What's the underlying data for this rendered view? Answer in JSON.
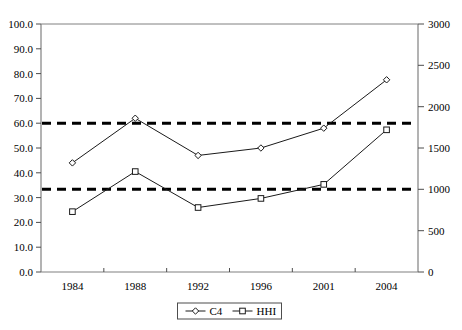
{
  "chart_data": {
    "type": "line",
    "title": "",
    "subtitle": "",
    "xlabel": "",
    "ylabel": "",
    "y2label": "",
    "categories": [
      "1984",
      "1988",
      "1992",
      "1996",
      "2001",
      "2004"
    ],
    "series": [
      {
        "name": "C4",
        "axis": "left",
        "marker": "diamond",
        "values": [
          44.0,
          62.0,
          47.0,
          50.0,
          58.0,
          77.5
        ]
      },
      {
        "name": "HHI",
        "axis": "right",
        "marker": "square",
        "values": [
          730,
          1215,
          780,
          890,
          1060,
          1720
        ]
      }
    ],
    "reference_lines": [
      {
        "name": "c4-threshold",
        "axis": "left",
        "value": 60.0,
        "style": "dashed"
      },
      {
        "name": "hhi-threshold",
        "axis": "right",
        "value": 1000,
        "style": "dashed"
      }
    ],
    "left_axis": {
      "min": 0.0,
      "max": 100.0,
      "step": 10.0,
      "ticks": [
        "0.0",
        "10.0",
        "20.0",
        "30.0",
        "40.0",
        "50.0",
        "60.0",
        "70.0",
        "80.0",
        "90.0",
        "100.0"
      ]
    },
    "right_axis": {
      "min": 0,
      "max": 3000,
      "step": 500,
      "ticks": [
        "0",
        "500",
        "1000",
        "1500",
        "2000",
        "2500",
        "3000"
      ]
    },
    "legend": {
      "position": "bottom",
      "entries": [
        {
          "label": "C4",
          "marker": "diamond"
        },
        {
          "label": "HHI",
          "marker": "square"
        }
      ]
    },
    "grid": false,
    "colors": {
      "series_line": "#1a1a1a",
      "reference_line": "#000000",
      "axis": "#808080",
      "text": "#000000",
      "background": "#ffffff"
    }
  }
}
